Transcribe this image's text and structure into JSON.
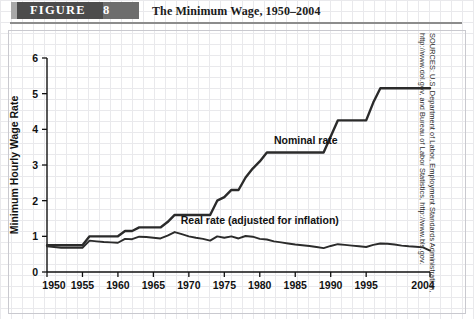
{
  "figure": {
    "badge_label": "FIGURE",
    "badge_number": "8",
    "title": "The Minimum Wage, 1950–2004"
  },
  "source": {
    "text": "SOURCES: U.S. Department of Labor, Employment Standards Administration, http://www.dol.gov, and Bureau of Labor Statistics, http://www.bls.gov."
  },
  "colors": {
    "line": "#2b2b2b",
    "badge_band": "#4c4c4c",
    "grid": "#e9e9ec",
    "axis": "#111111",
    "text": "#111111"
  },
  "chart_data": {
    "type": "line",
    "title": "The Minimum Wage, 1950–2004",
    "xlabel": "",
    "ylabel": "Minimum Hourly Wage Rate",
    "xlim": [
      1950,
      2004
    ],
    "ylim": [
      0,
      6
    ],
    "grid": true,
    "legend": "inline-annotations",
    "ytick_labels": [
      "0",
      "1",
      "2",
      "3",
      "4",
      "5",
      "6"
    ],
    "yticks": [
      0,
      1,
      2,
      3,
      4,
      5,
      6
    ],
    "xtick_labels": [
      "1950",
      "1955",
      "1960",
      "1965",
      "1970",
      "1975",
      "1980",
      "1985",
      "1990",
      "1995",
      "2004"
    ],
    "xticks": [
      1950,
      1955,
      1960,
      1965,
      1970,
      1975,
      1980,
      1985,
      1990,
      1995,
      2004
    ],
    "annotations": [
      {
        "text": "Nominal rate",
        "x": 1982,
        "y": 3.6
      },
      {
        "text": "Real rate (adjusted for inflation)",
        "x": 1980,
        "y": 1.35
      }
    ],
    "series": [
      {
        "name": "Nominal rate",
        "x": [
          1950,
          1951,
          1952,
          1953,
          1954,
          1955,
          1956,
          1957,
          1958,
          1959,
          1960,
          1961,
          1962,
          1963,
          1964,
          1965,
          1966,
          1967,
          1968,
          1969,
          1970,
          1971,
          1972,
          1973,
          1974,
          1975,
          1976,
          1977,
          1978,
          1979,
          1980,
          1981,
          1982,
          1983,
          1984,
          1985,
          1986,
          1987,
          1988,
          1989,
          1990,
          1991,
          1992,
          1993,
          1994,
          1995,
          1996,
          1997,
          1998,
          1999,
          2000,
          2001,
          2002,
          2003,
          2004
        ],
        "values": [
          0.75,
          0.75,
          0.75,
          0.75,
          0.75,
          0.75,
          1.0,
          1.0,
          1.0,
          1.0,
          1.0,
          1.15,
          1.15,
          1.25,
          1.25,
          1.25,
          1.25,
          1.4,
          1.6,
          1.6,
          1.6,
          1.6,
          1.6,
          1.6,
          2.0,
          2.1,
          2.3,
          2.3,
          2.65,
          2.9,
          3.1,
          3.35,
          3.35,
          3.35,
          3.35,
          3.35,
          3.35,
          3.35,
          3.35,
          3.35,
          3.8,
          4.25,
          4.25,
          4.25,
          4.25,
          4.25,
          4.75,
          5.15,
          5.15,
          5.15,
          5.15,
          5.15,
          5.15,
          5.15,
          5.15
        ]
      },
      {
        "name": "Real rate (adjusted for inflation)",
        "x": [
          1950,
          1951,
          1952,
          1953,
          1954,
          1955,
          1956,
          1957,
          1958,
          1959,
          1960,
          1961,
          1962,
          1963,
          1964,
          1965,
          1966,
          1967,
          1968,
          1969,
          1970,
          1971,
          1972,
          1973,
          1974,
          1975,
          1976,
          1977,
          1978,
          1979,
          1980,
          1981,
          1982,
          1983,
          1984,
          1985,
          1986,
          1987,
          1988,
          1989,
          1990,
          1991,
          1992,
          1993,
          1994,
          1995,
          1996,
          1997,
          1998,
          1999,
          2000,
          2001,
          2002,
          2003,
          2004
        ],
        "values": [
          0.72,
          0.7,
          0.68,
          0.68,
          0.68,
          0.68,
          0.88,
          0.86,
          0.84,
          0.83,
          0.82,
          0.93,
          0.92,
          0.99,
          0.98,
          0.96,
          0.94,
          1.02,
          1.12,
          1.06,
          1.0,
          0.96,
          0.93,
          0.88,
          1.0,
          0.96,
          1.0,
          0.94,
          1.01,
          0.99,
          0.93,
          0.91,
          0.86,
          0.83,
          0.8,
          0.77,
          0.75,
          0.73,
          0.7,
          0.67,
          0.73,
          0.78,
          0.76,
          0.74,
          0.72,
          0.7,
          0.76,
          0.8,
          0.79,
          0.77,
          0.74,
          0.72,
          0.71,
          0.69,
          0.6
        ]
      }
    ]
  }
}
